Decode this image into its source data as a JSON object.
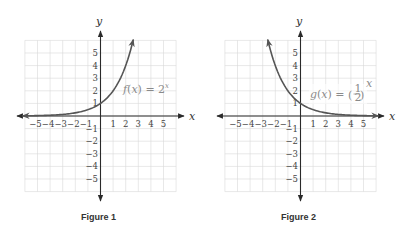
{
  "chart_data": [
    {
      "type": "line",
      "title": "Figure 1",
      "function_label": "f(x) = 2^x",
      "label_parts": {
        "name": "f",
        "var": "x",
        "eq": "=",
        "base": "2",
        "exp": "x"
      },
      "xlabel": "x",
      "ylabel": "y",
      "xlim": [
        -6,
        6
      ],
      "ylim": [
        -6,
        6
      ],
      "grid": true,
      "x_ticks": [
        "−5",
        "−4",
        "−3",
        "−2",
        "−1",
        "1",
        "2",
        "3",
        "4",
        "5"
      ],
      "y_ticks": [
        "5",
        "4",
        "3",
        "2",
        "1",
        "−1",
        "−2",
        "−3",
        "−4",
        "−5"
      ],
      "series": [
        {
          "name": "f(x) = 2^x",
          "x": [
            -6,
            -5,
            -4,
            -3,
            -2,
            -1,
            0,
            1,
            2,
            2.6
          ],
          "y": [
            0.016,
            0.031,
            0.063,
            0.125,
            0.25,
            0.5,
            1,
            2,
            4,
            6.06
          ]
        }
      ]
    },
    {
      "type": "line",
      "title": "Figure 2",
      "function_label": "g(x) = (1/2)^x",
      "label_parts": {
        "name": "g",
        "var": "x",
        "eq": "=",
        "num": "1",
        "den": "2",
        "exp": "x"
      },
      "xlabel": "x",
      "ylabel": "y",
      "xlim": [
        -6,
        6
      ],
      "ylim": [
        -6,
        6
      ],
      "grid": true,
      "x_ticks": [
        "−5",
        "−4",
        "−3",
        "−2",
        "−1",
        "1",
        "2",
        "3",
        "4",
        "5"
      ],
      "y_ticks": [
        "5",
        "4",
        "3",
        "2",
        "1",
        "−1",
        "−2",
        "−3",
        "−4",
        "−5"
      ],
      "series": [
        {
          "name": "g(x) = (1/2)^x",
          "x": [
            -2.6,
            -2,
            -1,
            0,
            1,
            2,
            3,
            4,
            5,
            6
          ],
          "y": [
            6.06,
            4,
            2,
            1,
            0.5,
            0.25,
            0.125,
            0.063,
            0.031,
            0.016
          ]
        }
      ]
    }
  ],
  "figures": [
    {
      "caption": "Figure 1",
      "x_axis_label": "x",
      "y_axis_label": "y"
    },
    {
      "caption": "Figure 2",
      "x_axis_label": "x",
      "y_axis_label": "y"
    }
  ],
  "colors": {
    "curve": "#555555",
    "axis": "#2a2a2a",
    "grid": "#d9d9d9",
    "label": "#8a8a8a"
  }
}
